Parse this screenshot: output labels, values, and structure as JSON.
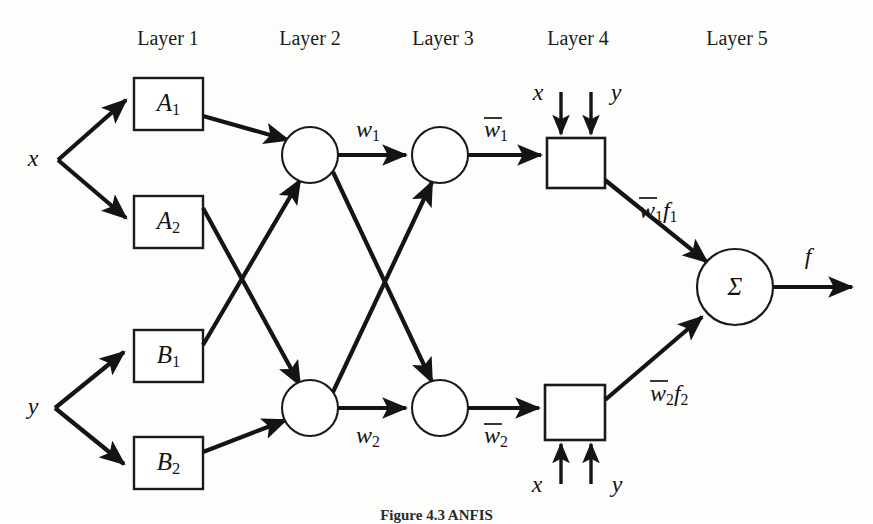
{
  "figure": {
    "caption": "Figure 4.3   ANFIS",
    "background_color": "#fdfdfc",
    "ink_color": "#141414"
  },
  "layer_headers": [
    {
      "label": "Layer 1"
    },
    {
      "label": "Layer 2"
    },
    {
      "label": "Layer 3"
    },
    {
      "label": "Layer 4"
    },
    {
      "label": "Layer 5"
    }
  ],
  "inputs": [
    {
      "label": "x"
    },
    {
      "label": "y"
    }
  ],
  "membership_nodes": [
    {
      "base": "A",
      "sub": "1"
    },
    {
      "base": "A",
      "sub": "2"
    },
    {
      "base": "B",
      "sub": "1"
    },
    {
      "base": "B",
      "sub": "2"
    }
  ],
  "layer2_labels": [
    {
      "base": "w",
      "sub": "1",
      "bar": false
    },
    {
      "base": "w",
      "sub": "2",
      "bar": false
    }
  ],
  "layer3_labels": [
    {
      "base": "w",
      "sub": "1",
      "bar": true
    },
    {
      "base": "w",
      "sub": "2",
      "bar": true
    }
  ],
  "layer4_box_inputs": {
    "top": [
      {
        "label": "x"
      },
      {
        "label": "y"
      }
    ],
    "bottom": [
      {
        "label": "x"
      },
      {
        "label": "y"
      }
    ]
  },
  "layer4_outputs": [
    {
      "w": "w",
      "w_sub": "1",
      "f": "f",
      "f_sub": "1"
    },
    {
      "w": "w",
      "w_sub": "2",
      "f": "f",
      "f_sub": "2"
    }
  ],
  "sum_node": {
    "symbol": "Σ",
    "output_label": "f"
  }
}
